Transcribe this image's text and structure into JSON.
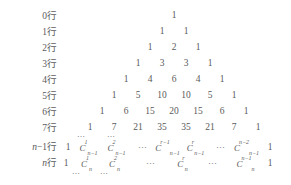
{
  "figure": {
    "text_color": "#5a5a5a",
    "background_color": "#ffffff",
    "row_suffix": "行"
  },
  "row_labels": [
    {
      "index": "0",
      "text": "0行"
    },
    {
      "index": "1",
      "text": "1行"
    },
    {
      "index": "2",
      "text": "2行"
    },
    {
      "index": "3",
      "text": "3行"
    },
    {
      "index": "4",
      "text": "4行"
    },
    {
      "index": "5",
      "text": "5行"
    },
    {
      "index": "6",
      "text": "6行"
    },
    {
      "index": "7",
      "text": "7行"
    },
    {
      "index": "n-1",
      "prefix": "n",
      "mid": "−1行",
      "text": "n−1行"
    },
    {
      "index": "n",
      "prefix": "n",
      "mid": "行",
      "text": "n行"
    }
  ],
  "numeric_rows": [
    {
      "label": "0行",
      "values": [
        "1"
      ]
    },
    {
      "label": "1行",
      "values": [
        "1",
        "1"
      ]
    },
    {
      "label": "2行",
      "values": [
        "1",
        "2",
        "1"
      ]
    },
    {
      "label": "3行",
      "values": [
        "1",
        "3",
        "3",
        "1"
      ]
    },
    {
      "label": "4行",
      "values": [
        "1",
        "4",
        "6",
        "4",
        "1"
      ]
    },
    {
      "label": "5行",
      "values": [
        "1",
        "5",
        "10",
        "10",
        "5",
        "1"
      ]
    },
    {
      "label": "6行",
      "values": [
        "1",
        "6",
        "15",
        "20",
        "15",
        "6",
        "1"
      ]
    },
    {
      "label": "7行",
      "values": [
        "1",
        "7",
        "21",
        "35",
        "35",
        "21",
        "7",
        "1"
      ]
    }
  ],
  "symbolic_rows": [
    {
      "label": "n−1行",
      "cells": [
        {
          "kind": "one",
          "text": "1"
        },
        {
          "kind": "binom",
          "base": "C",
          "sub": "n−1",
          "sup": "1"
        },
        {
          "kind": "binom",
          "base": "C",
          "sub": "n−1",
          "sup": "2"
        },
        {
          "kind": "dots",
          "text": "⋯"
        },
        {
          "kind": "binom",
          "base": "C",
          "sub": "n−1",
          "sup": "r−1"
        },
        {
          "kind": "binom",
          "base": "C",
          "sub": "n−1",
          "sup": "r"
        },
        {
          "kind": "dots",
          "text": "⋯"
        },
        {
          "kind": "binom",
          "base": "C",
          "sub": "n−1",
          "sup": "n−2"
        },
        {
          "kind": "one",
          "text": "1"
        }
      ]
    },
    {
      "label": "n行",
      "cells": [
        {
          "kind": "one",
          "text": "1"
        },
        {
          "kind": "binom",
          "base": "C",
          "sub": "n",
          "sup": "1"
        },
        {
          "kind": "binom",
          "base": "C",
          "sub": "n",
          "sup": "2"
        },
        {
          "kind": "dots",
          "text": "⋯"
        },
        {
          "kind": "binom",
          "base": "C",
          "sub": "n",
          "sup": "r"
        },
        {
          "kind": "dots",
          "text": "⋯"
        },
        {
          "kind": "binom",
          "base": "C",
          "sub": "n",
          "sup": "n−1"
        },
        {
          "kind": "one",
          "text": "1"
        }
      ]
    }
  ],
  "ellipses": {
    "above_left": "⋯",
    "above_right": "⋯",
    "below_left": "⋯",
    "below_right": "⋯"
  }
}
